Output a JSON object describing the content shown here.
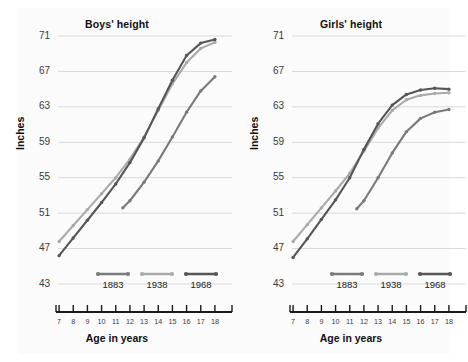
{
  "figure": {
    "background_color": "#ffffff",
    "panel_color": "#fbfbfb"
  },
  "series_colors": {
    "y1883": "#7a7a7a",
    "y1938": "#aaaaaa",
    "y1968": "#565656"
  },
  "legend": {
    "entries": [
      {
        "label": "1883",
        "color": "#7a7a7a"
      },
      {
        "label": "1938",
        "color": "#aaaaaa"
      },
      {
        "label": "1968",
        "color": "#565656"
      }
    ]
  },
  "axes": {
    "ylabel": "Inches",
    "xlabel": "Age in years",
    "yticks": [
      43,
      47,
      51,
      55,
      59,
      63,
      67,
      71
    ],
    "xticks": [
      7,
      8,
      9,
      10,
      11,
      12,
      13,
      14,
      15,
      16,
      17,
      18
    ],
    "ylim": [
      43,
      71
    ],
    "xlim": [
      6.5,
      18.5
    ],
    "grid": "horizontal"
  },
  "chart_data": [
    {
      "type": "line",
      "title": "Boys' height",
      "xlabel": "Age in years",
      "ylabel": "Inches",
      "ylim": [
        43,
        71
      ],
      "xlim": [
        6.5,
        18.5
      ],
      "grid": true,
      "legend_position": "inside-bottom",
      "x": [
        7,
        8,
        9,
        10,
        11,
        12,
        13,
        14,
        15,
        16,
        17,
        18
      ],
      "series": [
        {
          "name": "1883",
          "color": "#7a7a7a",
          "x": [
            11.5,
            12,
            13,
            14,
            15,
            16,
            17,
            18
          ],
          "values": [
            51.6,
            52.4,
            54.5,
            56.9,
            59.6,
            62.4,
            64.8,
            66.4
          ]
        },
        {
          "name": "1938",
          "color": "#aaaaaa",
          "x": [
            7,
            8,
            9,
            10,
            11,
            12,
            13,
            14,
            15,
            16,
            17,
            18
          ],
          "values": [
            47.8,
            49.6,
            51.4,
            53.2,
            55.0,
            57.1,
            59.6,
            62.6,
            65.6,
            68.0,
            69.6,
            70.3
          ]
        },
        {
          "name": "1968",
          "color": "#565656",
          "x": [
            7,
            8,
            9,
            10,
            11,
            12,
            13,
            14,
            15,
            16,
            17,
            18
          ],
          "values": [
            46.2,
            48.2,
            50.2,
            52.2,
            54.3,
            56.7,
            59.5,
            62.8,
            66.0,
            68.8,
            70.2,
            70.6
          ]
        }
      ]
    },
    {
      "type": "line",
      "title": "Girls' height",
      "xlabel": "Age in years",
      "ylabel": "Inches",
      "ylim": [
        43,
        71
      ],
      "xlim": [
        6.5,
        18.5
      ],
      "grid": true,
      "legend_position": "inside-bottom",
      "x": [
        7,
        8,
        9,
        10,
        11,
        12,
        13,
        14,
        15,
        16,
        17,
        18
      ],
      "series": [
        {
          "name": "1883",
          "color": "#7a7a7a",
          "x": [
            11.5,
            12,
            13,
            14,
            15,
            16,
            17,
            18
          ],
          "values": [
            51.5,
            52.4,
            55.0,
            57.8,
            60.2,
            61.7,
            62.4,
            62.7
          ]
        },
        {
          "name": "1938",
          "color": "#aaaaaa",
          "x": [
            7,
            8,
            9,
            10,
            11,
            12,
            13,
            14,
            15,
            16,
            17,
            18
          ],
          "values": [
            47.8,
            49.7,
            51.6,
            53.5,
            55.5,
            58.0,
            60.6,
            62.6,
            63.8,
            64.3,
            64.5,
            64.6
          ]
        },
        {
          "name": "1968",
          "color": "#565656",
          "x": [
            7,
            8,
            9,
            10,
            11,
            12,
            13,
            14,
            15,
            16,
            17,
            18
          ],
          "values": [
            46.0,
            48.1,
            50.3,
            52.5,
            55.0,
            58.2,
            61.1,
            63.2,
            64.4,
            64.9,
            65.1,
            65.0
          ]
        }
      ]
    }
  ]
}
